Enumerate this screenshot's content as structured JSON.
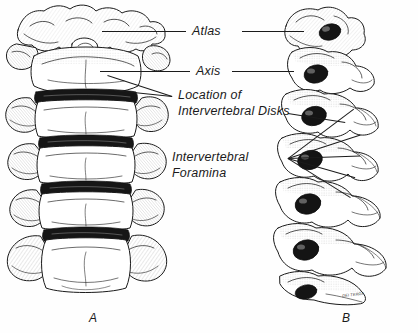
{
  "figure": {
    "type": "anatomical-illustration",
    "style": "pen-and-ink line drawing",
    "background_color": "#ffffff",
    "ink_color": "#1a1a1a"
  },
  "panels": [
    {
      "id": "A",
      "label": "A",
      "view": "anterior",
      "description": "Anterior view of the cervical spine showing stacked vertebral bodies with dark intervertebral disk spaces"
    },
    {
      "id": "B",
      "label": "B",
      "view": "lateral",
      "description": "Lateral view of the cervical spine showing intervertebral foramina as dark oval openings"
    }
  ],
  "labels": {
    "atlas": "Atlas",
    "axis": "Axis",
    "disks_line1": "Location of",
    "disks_line2": "Intervertebral Disks",
    "foramina_line1": "Intervertebral",
    "foramina_line2": "Foramina"
  },
  "signature": "DEI TERRA"
}
